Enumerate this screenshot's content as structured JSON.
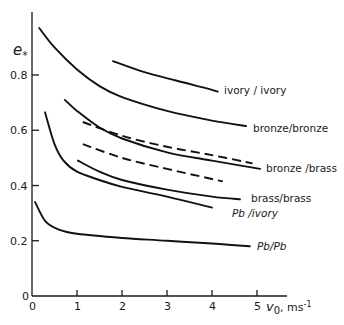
{
  "chart_data": {
    "type": "line",
    "title": "",
    "xlabel": "v0, ms-1",
    "ylabel": "e*",
    "xlim": [
      0,
      5.3
    ],
    "ylim": [
      0,
      1.0
    ],
    "x_ticks": [
      0,
      1,
      2,
      3,
      4,
      5
    ],
    "y_ticks": [
      0,
      0.2,
      0.4,
      0.6,
      0.8
    ],
    "x_tick_labels": [
      "0",
      "1",
      "2",
      "3",
      "4",
      "5"
    ],
    "y_tick_labels": [
      "0",
      "0.2",
      "0.4",
      "0.6",
      "0.8"
    ],
    "grid": false,
    "legend": "inline labels at curve ends",
    "series": [
      {
        "name": "ivory / ivory",
        "style": "solid",
        "x": [
          1.8,
          2.5,
          3.2,
          3.8,
          4.13
        ],
        "y": [
          0.85,
          0.81,
          0.78,
          0.755,
          0.74
        ]
      },
      {
        "name": "bronze/bronze",
        "style": "solid",
        "x": [
          0.16,
          0.5,
          1.0,
          1.5,
          2.0,
          3.0,
          4.0,
          4.76
        ],
        "y": [
          0.97,
          0.9,
          0.82,
          0.76,
          0.72,
          0.67,
          0.635,
          0.615
        ]
      },
      {
        "name": "bronze /brass",
        "style": "solid",
        "x": [
          0.73,
          1.0,
          1.5,
          2.0,
          3.0,
          4.0,
          5.07
        ],
        "y": [
          0.71,
          0.67,
          0.61,
          0.57,
          0.52,
          0.49,
          0.46
        ]
      },
      {
        "name": "bronze/brass (dashed, upper)",
        "style": "dashed",
        "x": [
          1.13,
          2.0,
          3.0,
          4.0,
          4.9
        ],
        "y": [
          0.63,
          0.58,
          0.54,
          0.51,
          0.48
        ]
      },
      {
        "name": "dashed (lower)",
        "style": "dashed",
        "x": [
          1.13,
          2.0,
          3.0,
          4.24
        ],
        "y": [
          0.55,
          0.5,
          0.46,
          0.415
        ]
      },
      {
        "name": "brass/brass",
        "style": "solid",
        "x": [
          1.02,
          1.5,
          2.0,
          3.0,
          4.0,
          4.62
        ],
        "y": [
          0.49,
          0.45,
          0.42,
          0.385,
          0.36,
          0.35
        ]
      },
      {
        "name": "Pb /ivory",
        "style": "solid",
        "x": [
          0.29,
          0.5,
          0.7,
          1.0,
          1.5,
          2.0,
          3.0,
          4.0
        ],
        "y": [
          0.665,
          0.55,
          0.49,
          0.45,
          0.42,
          0.395,
          0.36,
          0.32
        ]
      },
      {
        "name": "Pb/Pb",
        "style": "solid",
        "x": [
          0.07,
          0.3,
          0.6,
          1.0,
          2.0,
          3.0,
          4.0,
          4.84
        ],
        "y": [
          0.34,
          0.27,
          0.24,
          0.225,
          0.21,
          0.2,
          0.19,
          0.18
        ]
      }
    ]
  },
  "axes": {
    "y_label_main": "e",
    "y_label_sub": "*",
    "x_label_main": "v",
    "x_label_sub": "0",
    "x_label_units": ", ms",
    "x_label_exp": "-1"
  },
  "labels": {
    "ivory_ivory": "ivory / ivory",
    "bronze_bronze": "bronze/bronze",
    "bronze_brass": "bronze /brass",
    "brass_brass": "brass/brass",
    "pb_ivory": "Pb /ivory",
    "pb_pb": "Pb/Pb"
  },
  "ticks": {
    "x": [
      "0",
      "1",
      "2",
      "3",
      "4",
      "5"
    ],
    "y": [
      "0",
      "0.2",
      "0.4",
      "0.6",
      "0.8"
    ]
  }
}
